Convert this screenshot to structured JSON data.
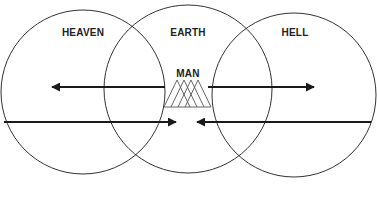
{
  "diagram": {
    "labels": {
      "heaven": "HEAVEN",
      "earth": "EARTH",
      "hell": "HELL",
      "man": "MAN"
    },
    "circles": [
      {
        "name": "heaven",
        "cx": 83,
        "cy": 92,
        "r": 82
      },
      {
        "name": "earth",
        "cx": 188,
        "cy": 89,
        "r": 84
      },
      {
        "name": "hell",
        "cx": 294,
        "cy": 95,
        "r": 82
      }
    ],
    "arrows": [
      {
        "name": "man-to-heaven",
        "from": [
          165,
          87
        ],
        "to": [
          50,
          87
        ],
        "direction": "left"
      },
      {
        "name": "man-to-hell",
        "from": [
          208,
          87
        ],
        "to": [
          316,
          87
        ],
        "direction": "right"
      },
      {
        "name": "heaven-to-earth",
        "from": [
          4,
          122
        ],
        "to": [
          178,
          122
        ],
        "direction": "right"
      },
      {
        "name": "hell-to-earth",
        "from": [
          371,
          122
        ],
        "to": [
          195,
          122
        ],
        "direction": "left"
      }
    ],
    "colors": {
      "line": "#333333",
      "arrow": "#1a1a1a",
      "text": "#222222",
      "background": "#ffffff"
    }
  }
}
